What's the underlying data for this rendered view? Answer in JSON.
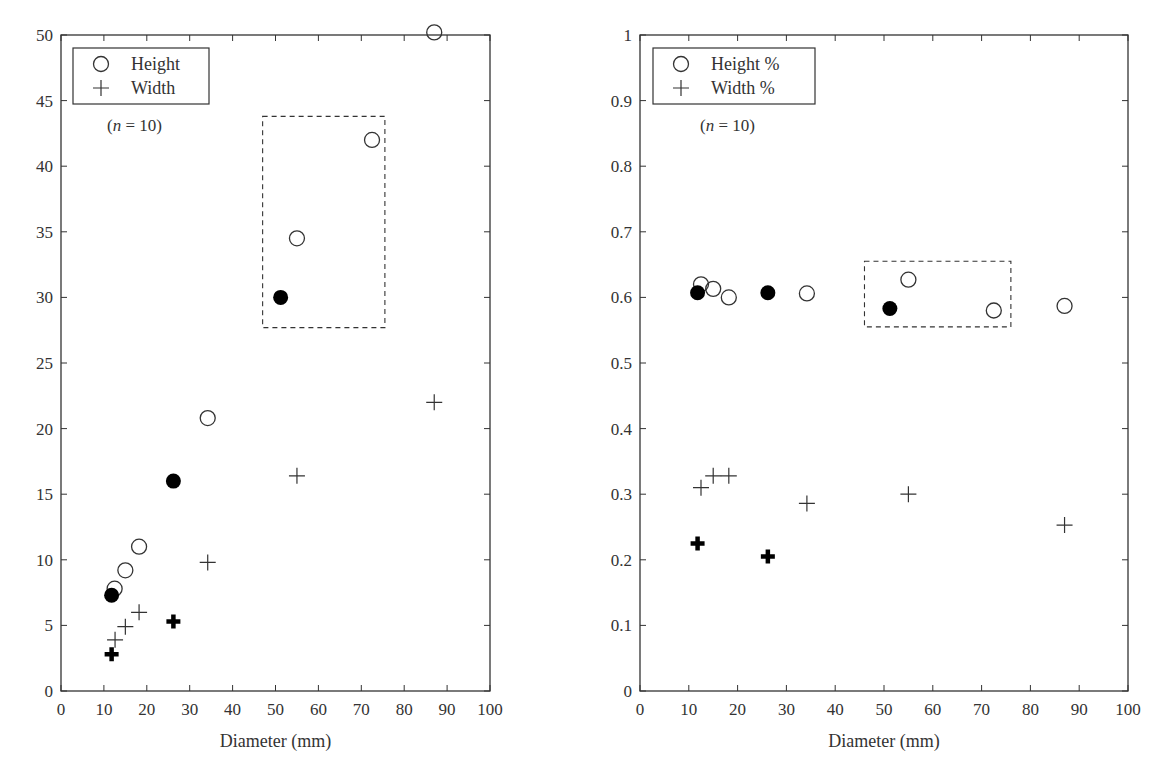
{
  "chart_data": [
    {
      "type": "scatter",
      "panel": "left",
      "title": "",
      "xlabel": "Diameter (mm)",
      "ylabel": "",
      "xlim": [
        0,
        100
      ],
      "ylim": [
        0,
        50
      ],
      "xticks": [
        0,
        10,
        20,
        30,
        40,
        50,
        60,
        70,
        80,
        90,
        100
      ],
      "yticks": [
        0,
        5,
        10,
        15,
        20,
        25,
        30,
        35,
        40,
        45,
        50
      ],
      "grid": false,
      "legend": {
        "position": "upper-left",
        "entries": [
          "Height",
          "Width"
        ]
      },
      "annotation": "(n = 10)",
      "highlight_box": {
        "x": [
          47,
          75.5
        ],
        "y": [
          27.7,
          43.8
        ],
        "style": "dashed"
      },
      "series": [
        {
          "name": "Height",
          "marker": "open-circle",
          "points": [
            [
              12.5,
              7.8
            ],
            [
              15,
              9.2
            ],
            [
              18.2,
              11
            ],
            [
              34.2,
              20.8
            ],
            [
              55,
              34.5
            ],
            [
              72.5,
              42
            ],
            [
              87,
              50.2
            ]
          ]
        },
        {
          "name": "Height (highlighted)",
          "marker": "filled-circle",
          "points": [
            [
              11.8,
              7.3
            ],
            [
              26.2,
              16
            ],
            [
              51.2,
              30
            ]
          ]
        },
        {
          "name": "Width",
          "marker": "thin-plus",
          "points": [
            [
              12.6,
              3.9
            ],
            [
              15,
              4.9
            ],
            [
              18.2,
              6
            ],
            [
              34.2,
              9.8
            ],
            [
              55,
              16.4
            ],
            [
              87,
              22
            ]
          ]
        },
        {
          "name": "Width (highlighted)",
          "marker": "bold-plus",
          "points": [
            [
              11.8,
              2.8
            ],
            [
              26.2,
              5.3
            ]
          ]
        }
      ]
    },
    {
      "type": "scatter",
      "panel": "right",
      "title": "",
      "xlabel": "Diameter (mm)",
      "ylabel": "",
      "xlim": [
        0,
        100
      ],
      "ylim": [
        0,
        1
      ],
      "xticks": [
        0,
        10,
        20,
        30,
        40,
        50,
        60,
        70,
        80,
        90,
        100
      ],
      "yticks": [
        0,
        0.1,
        0.2,
        0.3,
        0.4,
        0.5,
        0.6,
        0.7,
        0.8,
        0.9,
        1
      ],
      "grid": false,
      "legend": {
        "position": "upper-left",
        "entries": [
          "Height %",
          "Width %"
        ]
      },
      "annotation": "(n = 10)",
      "highlight_box": {
        "x": [
          46,
          76
        ],
        "y": [
          0.555,
          0.655
        ],
        "style": "dashed"
      },
      "series": [
        {
          "name": "Height %",
          "marker": "open-circle",
          "points": [
            [
              12.5,
              0.62
            ],
            [
              15,
              0.613
            ],
            [
              18.2,
              0.6
            ],
            [
              34.2,
              0.606
            ],
            [
              55,
              0.627
            ],
            [
              72.5,
              0.58
            ],
            [
              87,
              0.587
            ]
          ]
        },
        {
          "name": "Height % (highlighted)",
          "marker": "filled-circle",
          "points": [
            [
              11.8,
              0.607
            ],
            [
              26.2,
              0.607
            ],
            [
              51.2,
              0.583
            ]
          ]
        },
        {
          "name": "Width %",
          "marker": "thin-plus",
          "points": [
            [
              12.5,
              0.31
            ],
            [
              15,
              0.328
            ],
            [
              18.2,
              0.328
            ],
            [
              34.2,
              0.286
            ],
            [
              55,
              0.3
            ],
            [
              87,
              0.253
            ]
          ]
        },
        {
          "name": "Width % (highlighted)",
          "marker": "bold-plus",
          "points": [
            [
              11.8,
              0.225
            ],
            [
              26.2,
              0.205
            ]
          ]
        }
      ]
    }
  ],
  "left_chart": {
    "xlabel": "Diameter (mm)",
    "legend_height": "Height",
    "legend_width": "Width",
    "note_n": "n",
    "note_eq": " = 10)",
    "note_open": "(",
    "xtick_labels": [
      "0",
      "10",
      "20",
      "30",
      "40",
      "50",
      "60",
      "70",
      "80",
      "90",
      "100"
    ],
    "ytick_labels": [
      "0",
      "5",
      "10",
      "15",
      "20",
      "25",
      "30",
      "35",
      "40",
      "45",
      "50"
    ]
  },
  "right_chart": {
    "xlabel": "Diameter (mm)",
    "legend_height": "Height %",
    "legend_width": "Width %",
    "note_n": "n",
    "note_eq": " = 10)",
    "note_open": "(",
    "xtick_labels": [
      "0",
      "10",
      "20",
      "30",
      "40",
      "50",
      "60",
      "70",
      "80",
      "90",
      "100"
    ],
    "ytick_labels": [
      "0",
      "0.1",
      "0.2",
      "0.3",
      "0.4",
      "0.5",
      "0.6",
      "0.7",
      "0.8",
      "0.9",
      "1"
    ]
  },
  "colors": {
    "axis": "#333333",
    "marker": "#000000",
    "background": "#ffffff"
  }
}
